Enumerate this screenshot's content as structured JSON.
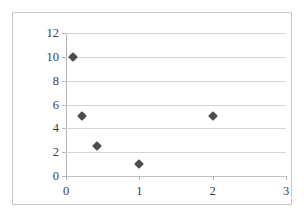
{
  "chart_data": {
    "type": "scatter",
    "title": "",
    "xlabel": "",
    "ylabel": "",
    "xlim": [
      0,
      3
    ],
    "ylim": [
      0,
      12
    ],
    "xticks": [
      "0",
      "1",
      "2",
      "3"
    ],
    "xtick_values": [
      0,
      1,
      2,
      3
    ],
    "yticks": [
      "0",
      "2",
      "4",
      "6",
      "8",
      "10",
      "12"
    ],
    "ytick_values": [
      0,
      2,
      4,
      6,
      8,
      10,
      12
    ],
    "grid": "horizontal",
    "legend": "none",
    "marker": "diamond",
    "marker_color": "#4d4d4d",
    "series": [
      {
        "name": "Series 1",
        "points": [
          {
            "x": 0.1,
            "y": 10
          },
          {
            "x": 0.22,
            "y": 5
          },
          {
            "x": 0.42,
            "y": 2.5
          },
          {
            "x": 1,
            "y": 1
          },
          {
            "x": 2,
            "y": 5
          }
        ]
      }
    ]
  },
  "style": {
    "border_color": "#c8c8c8",
    "gridline_color": "#d4d4d4",
    "axis_color": "#b4b4b4",
    "tick_label_color": "#3d3d3d",
    "background": "#ffffff"
  }
}
